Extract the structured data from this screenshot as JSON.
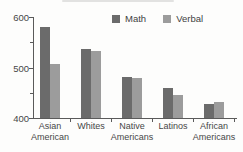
{
  "chart_data": {
    "type": "bar",
    "title": "",
    "categories": [
      "Asian American",
      "Whites",
      "Native Americans",
      "Latinos",
      "African Americans"
    ],
    "category_label_lines": [
      [
        "Asian",
        "American"
      ],
      [
        "Whites"
      ],
      [
        "Native",
        "Americans"
      ],
      [
        "Latinos"
      ],
      [
        "African",
        "Americans"
      ]
    ],
    "series": [
      {
        "name": "Math",
        "color": "#6b6b6b",
        "values": [
          580,
          537,
          481,
          460,
          427
        ]
      },
      {
        "name": "Verbal",
        "color": "#9c9c9c",
        "values": [
          507,
          532,
          479,
          446,
          432
        ]
      }
    ],
    "xlabel": "",
    "ylabel": "",
    "ylim": [
      400,
      600
    ],
    "y_major_ticks": [
      400,
      500,
      600
    ],
    "y_major_tick_labels": [
      "400",
      "500",
      "600"
    ],
    "y_minor_ticks": [
      450,
      550
    ],
    "legend_position": "top",
    "grid": false,
    "axis_color": "#5a5a5a",
    "text_color": "#474747"
  }
}
